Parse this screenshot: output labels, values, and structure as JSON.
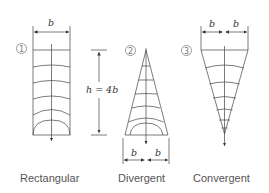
{
  "diagram": {
    "panels": [
      {
        "number": "1",
        "name": "Rectangular",
        "top_dimension": "b"
      },
      {
        "number": "2",
        "name": "Divergent",
        "bottom_dimensions": [
          "b",
          "b"
        ]
      },
      {
        "number": "3",
        "name": "Convergent",
        "top_dimensions": [
          "b",
          "b"
        ]
      }
    ],
    "height_label": "h = 4b",
    "stroke_color": "#333333",
    "label_color": "#555555"
  }
}
